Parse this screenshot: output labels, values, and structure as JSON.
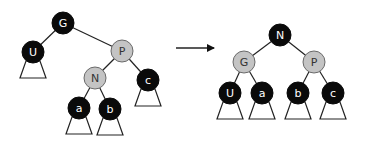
{
  "colors": {
    "black_node": "#0a0a0a",
    "gray_node": "#c4c4c4",
    "gray_stroke": "#6a6a6a",
    "edge": "#222222",
    "black_text": "#333333",
    "white_text": "#ffffff"
  },
  "left_tree": {
    "nodes": [
      {
        "id": "G",
        "label": "G",
        "x": 63,
        "y": 23,
        "color": "black"
      },
      {
        "id": "U",
        "label": "U",
        "x": 33,
        "y": 52,
        "color": "black"
      },
      {
        "id": "P",
        "label": "P",
        "x": 122,
        "y": 51,
        "color": "gray"
      },
      {
        "id": "N",
        "label": "N",
        "x": 95,
        "y": 78,
        "color": "gray"
      },
      {
        "id": "c",
        "label": "c",
        "x": 148,
        "y": 80,
        "color": "black"
      },
      {
        "id": "a",
        "label": "a",
        "x": 79,
        "y": 108,
        "color": "black"
      },
      {
        "id": "b",
        "label": "b",
        "x": 110,
        "y": 109,
        "color": "black"
      }
    ],
    "edges": [
      [
        "G",
        "U"
      ],
      [
        "G",
        "P"
      ],
      [
        "P",
        "N"
      ],
      [
        "P",
        "c"
      ],
      [
        "N",
        "a"
      ],
      [
        "N",
        "b"
      ]
    ],
    "subtrees": [
      "U",
      "c",
      "a",
      "b"
    ]
  },
  "arrow": {
    "x1": 176,
    "y1": 48,
    "x2": 214,
    "y2": 48
  },
  "right_tree": {
    "nodes": [
      {
        "id": "N",
        "label": "N",
        "x": 280,
        "y": 35,
        "color": "black"
      },
      {
        "id": "G",
        "label": "G",
        "x": 244,
        "y": 62,
        "color": "gray"
      },
      {
        "id": "P",
        "label": "P",
        "x": 314,
        "y": 62,
        "color": "gray"
      },
      {
        "id": "U",
        "label": "U",
        "x": 230,
        "y": 93,
        "color": "black"
      },
      {
        "id": "a",
        "label": "a",
        "x": 262,
        "y": 93,
        "color": "black"
      },
      {
        "id": "b",
        "label": "b",
        "x": 298,
        "y": 93,
        "color": "black"
      },
      {
        "id": "c",
        "label": "c",
        "x": 333,
        "y": 93,
        "color": "black"
      }
    ],
    "edges": [
      [
        "N",
        "G"
      ],
      [
        "N",
        "P"
      ],
      [
        "G",
        "U"
      ],
      [
        "G",
        "a"
      ],
      [
        "P",
        "b"
      ],
      [
        "P",
        "c"
      ]
    ],
    "subtrees": [
      "U",
      "a",
      "b",
      "c"
    ]
  },
  "node_radius": 11
}
